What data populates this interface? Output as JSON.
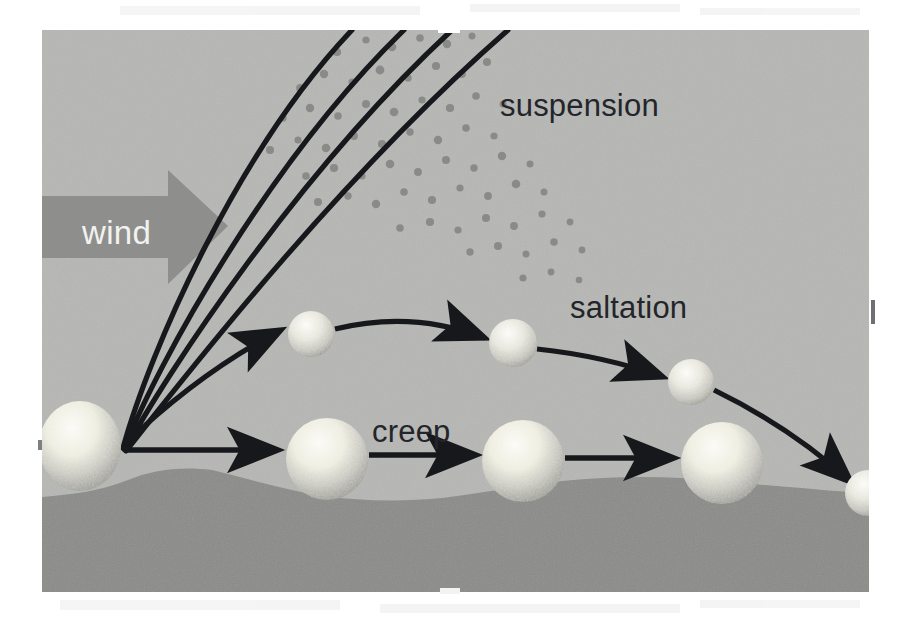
{
  "figure": {
    "panel": {
      "x": 42,
      "y": 30,
      "width": 827,
      "height": 562
    },
    "colors": {
      "page_background": "#ffffff",
      "sky_panel": "#b6b7b4",
      "ground": "#8b8c89",
      "wind_arrow": "#8e8f8c",
      "wind_text": "#f2f2f0",
      "label_text": "#23252a",
      "trajectory_line": "#17181b",
      "grain_light": "#f4f3ee",
      "grain_mid": "#cfcec7",
      "grain_shadow": "#9b9b95",
      "dust_dot": "#8a8b88"
    }
  },
  "labels": [
    {
      "id": "suspension",
      "text": "suspension",
      "x": 500,
      "y": 116,
      "font_size": 31
    },
    {
      "id": "saltation",
      "text": "saltation",
      "x": 570,
      "y": 318,
      "font_size": 31
    },
    {
      "id": "creep",
      "text": "creep",
      "x": 372,
      "y": 442,
      "font_size": 31
    }
  ],
  "wind_arrow": {
    "label": "wind",
    "label_x": 82,
    "label_y": 244,
    "shaft": {
      "x": 42,
      "y": 195,
      "width": 130,
      "height": 62
    },
    "head": {
      "tip_x": 225,
      "top_y": 172,
      "bottom_y": 282,
      "back_x": 168
    }
  },
  "source_grain": {
    "cx": 80,
    "cy": 446,
    "rx": 40,
    "ry": 45
  },
  "launch_point": {
    "x": 122,
    "y": 449
  },
  "suspension": {
    "description": "Four diverging curved trajectories of fine dust rising off the bed and leaving the top of the frame, with scattered dust particles between them.",
    "trajectories": [
      {
        "id": "susp-1",
        "end_x": 352,
        "end_y": 30,
        "control_x": 175,
        "control_y": 250
      },
      {
        "id": "susp-2",
        "end_x": 404,
        "end_y": 30,
        "control_x": 195,
        "control_y": 270
      },
      {
        "id": "susp-3",
        "end_x": 452,
        "end_y": 30,
        "control_x": 215,
        "control_y": 290
      },
      {
        "id": "susp-4",
        "end_x": 508,
        "end_y": 30,
        "control_x": 240,
        "control_y": 310
      }
    ],
    "dust_dots": [
      [
        337,
        52
      ],
      [
        366,
        40
      ],
      [
        392,
        47
      ],
      [
        420,
        38
      ],
      [
        447,
        44
      ],
      [
        472,
        36
      ],
      [
        300,
        88
      ],
      [
        324,
        74
      ],
      [
        352,
        82
      ],
      [
        380,
        70
      ],
      [
        408,
        78
      ],
      [
        436,
        66
      ],
      [
        462,
        74
      ],
      [
        487,
        62
      ],
      [
        283,
        118
      ],
      [
        310,
        108
      ],
      [
        338,
        116
      ],
      [
        366,
        104
      ],
      [
        394,
        112
      ],
      [
        422,
        100
      ],
      [
        450,
        108
      ],
      [
        476,
        96
      ],
      [
        503,
        104
      ],
      [
        270,
        150
      ],
      [
        298,
        140
      ],
      [
        326,
        148
      ],
      [
        354,
        136
      ],
      [
        382,
        144
      ],
      [
        410,
        132
      ],
      [
        438,
        140
      ],
      [
        466,
        128
      ],
      [
        494,
        136
      ],
      [
        306,
        176
      ],
      [
        334,
        168
      ],
      [
        362,
        176
      ],
      [
        390,
        164
      ],
      [
        418,
        172
      ],
      [
        446,
        160
      ],
      [
        474,
        168
      ],
      [
        502,
        156
      ],
      [
        530,
        164
      ],
      [
        318,
        202
      ],
      [
        348,
        196
      ],
      [
        376,
        204
      ],
      [
        404,
        192
      ],
      [
        432,
        200
      ],
      [
        460,
        188
      ],
      [
        488,
        196
      ],
      [
        516,
        184
      ],
      [
        544,
        192
      ],
      [
        400,
        228
      ],
      [
        430,
        222
      ],
      [
        458,
        230
      ],
      [
        486,
        218
      ],
      [
        514,
        226
      ],
      [
        542,
        214
      ],
      [
        570,
        222
      ],
      [
        470,
        252
      ],
      [
        498,
        246
      ],
      [
        526,
        254
      ],
      [
        554,
        242
      ],
      [
        582,
        250
      ],
      [
        523,
        278
      ],
      [
        551,
        272
      ],
      [
        579,
        280
      ]
    ]
  },
  "saltation": {
    "description": "Sand grains bouncing in arcs along the bed — launch, two hops, and landing at the right edge.",
    "grains": [
      {
        "id": "salt-grain-1",
        "cx": 311,
        "cy": 334,
        "r": 22
      },
      {
        "id": "salt-grain-2",
        "cx": 513,
        "cy": 343,
        "r": 23
      },
      {
        "id": "salt-grain-3",
        "cx": 692,
        "cy": 382,
        "r": 22
      },
      {
        "id": "salt-grain-4",
        "cx": 866,
        "cy": 492,
        "r": 22
      }
    ],
    "arcs": [
      {
        "id": "salt-arc-0",
        "from": [
          125,
          445
        ],
        "to": [
          286,
          331
        ],
        "ctrl": [
          205,
          366
        ]
      },
      {
        "id": "salt-arc-1",
        "from": [
          335,
          330
        ],
        "to": [
          489,
          339
        ],
        "ctrl": [
          412,
          312
        ]
      },
      {
        "id": "salt-arc-2",
        "from": [
          537,
          349
        ],
        "to": [
          667,
          379
        ],
        "ctrl": [
          603,
          356
        ]
      },
      {
        "id": "salt-arc-3",
        "from": [
          714,
          389
        ],
        "to": [
          856,
          486
        ],
        "ctrl": [
          790,
          425
        ]
      }
    ]
  },
  "creep": {
    "description": "Large grains rolling and sliding along the bed surface pushed by straight horizontal arrows.",
    "grains": [
      {
        "id": "creep-grain-1",
        "cx": 327,
        "cy": 459,
        "r": 40
      },
      {
        "id": "creep-grain-2",
        "cx": 523,
        "cy": 461,
        "r": 40
      },
      {
        "id": "creep-grain-3",
        "cx": 722,
        "cy": 463,
        "r": 40
      }
    ],
    "arrows": [
      {
        "id": "creep-arrow-0",
        "from": [
          126,
          450
        ],
        "to": [
          283,
          450
        ]
      },
      {
        "id": "creep-arrow-1",
        "from": [
          369,
          455
        ],
        "to": [
          480,
          455
        ]
      },
      {
        "id": "creep-arrow-2",
        "from": [
          565,
          458
        ],
        "to": [
          678,
          458
        ]
      }
    ]
  },
  "ground": {
    "description": "Undulating darker sand bed filling the lower portion of the panel.",
    "profile": [
      [
        42,
        497
      ],
      [
        72,
        494
      ],
      [
        100,
        490
      ],
      [
        128,
        480
      ],
      [
        152,
        471
      ],
      [
        180,
        468
      ],
      [
        210,
        470
      ],
      [
        246,
        478
      ],
      [
        282,
        488
      ],
      [
        320,
        496
      ],
      [
        360,
        500
      ],
      [
        400,
        501
      ],
      [
        442,
        498
      ],
      [
        480,
        492
      ],
      [
        520,
        486
      ],
      [
        560,
        481
      ],
      [
        600,
        478
      ],
      [
        640,
        477
      ],
      [
        680,
        478
      ],
      [
        720,
        481
      ],
      [
        760,
        484
      ],
      [
        800,
        488
      ],
      [
        835,
        491
      ],
      [
        869,
        493
      ]
    ]
  },
  "scan_artifacts": {
    "right_edge_tick": {
      "x": 872,
      "y": 300,
      "width": 4,
      "height": 24
    },
    "top_notch": {
      "x": 438,
      "y": 30,
      "width": 22,
      "height": 5
    },
    "bottom_notch": {
      "x": 440,
      "y": 588,
      "width": 20,
      "height": 5
    }
  }
}
